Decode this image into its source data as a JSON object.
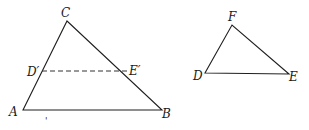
{
  "figure": {
    "colors": {
      "line": "#1f1f1f",
      "background": "#ffffff"
    },
    "triangle_abc": {
      "vertices": {
        "A": {
          "label": "A",
          "x": 23,
          "y": 110
        },
        "B": {
          "label": "B",
          "x": 162,
          "y": 110
        },
        "C": {
          "label": "C",
          "x": 67,
          "y": 21
        }
      },
      "segment_dprime_eprime": {
        "style": "dashed",
        "D_prime": {
          "label": "D′",
          "x": 42,
          "y": 71
        },
        "E_prime": {
          "label": "E′",
          "x": 129,
          "y": 71
        }
      }
    },
    "triangle_def": {
      "vertices": {
        "D": {
          "label": "D",
          "x": 205,
          "y": 73
        },
        "E": {
          "label": "E",
          "x": 289,
          "y": 74
        },
        "F": {
          "label": "F",
          "x": 232,
          "y": 25
        }
      }
    },
    "stray_mark": {
      "label": "'",
      "x": 46,
      "y": 121
    }
  }
}
